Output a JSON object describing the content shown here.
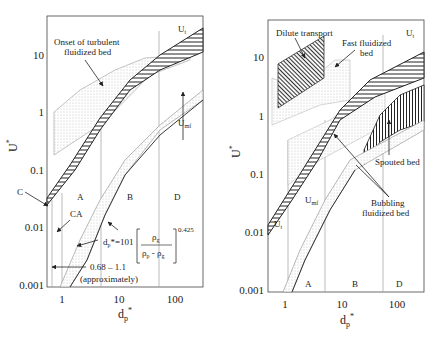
{
  "left_plot": {
    "y_axis_label": "U",
    "y_axis_label_sup": "*",
    "x_axis_label": "d",
    "x_axis_label_sub": "p",
    "x_axis_label_sup": "*",
    "y_ticks": [
      "10",
      "1",
      "0.1",
      "0.01",
      "0.001"
    ],
    "x_ticks": [
      "1",
      "10",
      "100"
    ],
    "annotations": {
      "turbulent_line1": "Onset of turbulent",
      "turbulent_line2": "fluidized bed",
      "ut": "U",
      "ut_sub": "t",
      "umf": "U",
      "umf_sub": "mf",
      "c": "C",
      "ca": "CA",
      "a": "A",
      "b": "B",
      "d": "D",
      "range": "0.68 – 1.1",
      "approx": "(approximately)",
      "formula_lhs": "d",
      "formula_lhs_sub": "p",
      "formula_eq": "*=101",
      "formula_num": "ρ",
      "formula_num_sub": "g",
      "formula_den": "ρ",
      "formula_den_sub1": "p",
      "formula_den_minus": " - ρ",
      "formula_den_sub2": "g",
      "formula_exp": "0.425"
    }
  },
  "right_plot": {
    "y_axis_label": "U",
    "y_axis_label_sup": "*",
    "x_axis_label": "d",
    "x_axis_label_sub": "p",
    "x_axis_label_sup": "*",
    "y_ticks": [
      "10",
      "1",
      "0.1",
      "0.01",
      "0.001"
    ],
    "x_ticks": [
      "1",
      "10",
      "100"
    ],
    "annotations": {
      "dilute": "Dilute transport",
      "fast_line1": "Fast fluidized",
      "fast_line2": "bed",
      "ut_top": "U",
      "ut_top_sub": "t",
      "ut_bottom": "U",
      "ut_bottom_sub": "t",
      "umf": "U",
      "umf_sub": "mf",
      "spouted": "Spouted bed",
      "bubbling_line1": "Bubbling",
      "bubbling_line2": "fluidized bed",
      "a": "A",
      "b": "B",
      "d": "D"
    }
  },
  "colors": {
    "line": "#222222",
    "grey_line": "#9a9a9a",
    "stipple": "#b0b0b0",
    "background": "#ffffff"
  }
}
